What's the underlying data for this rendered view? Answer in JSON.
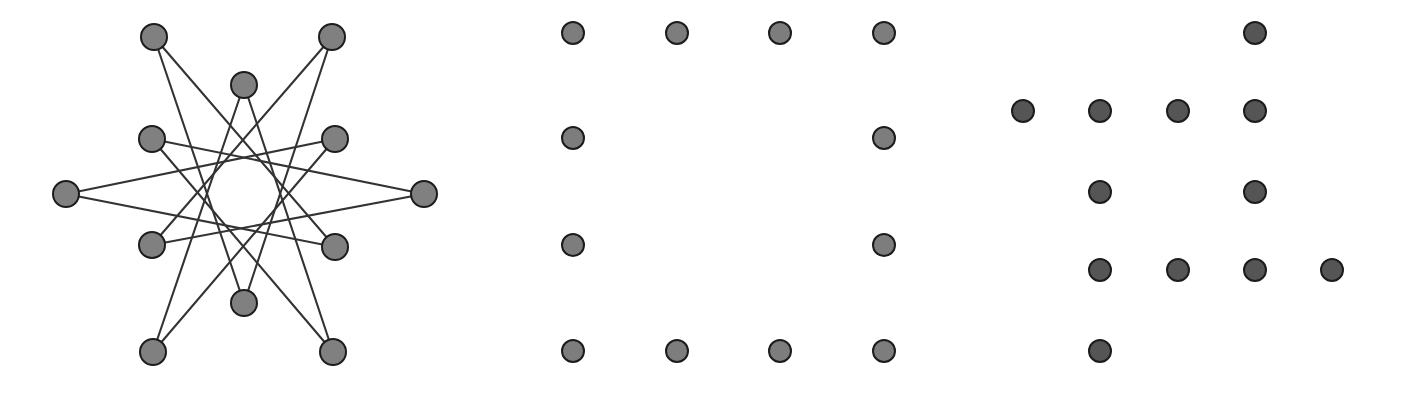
{
  "figure": {
    "width": 1402,
    "height": 394,
    "background": "#ffffff"
  },
  "style": {
    "node_fill": "#808080",
    "node_stroke": "#1c1c1c",
    "node_stroke_width": 2.0,
    "dot_fill_middle": "#7d7d7d",
    "dot_fill_right": "#555555",
    "dot_stroke": "#1c1c1c",
    "dot_stroke_width": 2.0,
    "edge_color": "#333333",
    "edge_width": 2.1
  },
  "chart_data": {
    "type": "scatter",
    "title": "",
    "xlabel": "",
    "ylabel": "",
    "xlim": [
      0,
      1402
    ],
    "ylim": [
      0,
      394
    ],
    "grid": false,
    "legend": null,
    "panels": [
      {
        "name": "star-polygon-graph",
        "label": "graph-panel",
        "node_radius": 13,
        "node_count": 12,
        "edge_count": 12,
        "nodes": [
          {
            "id": 0,
            "x": 244,
            "y": 85,
            "name": "node-top-center"
          },
          {
            "id": 1,
            "x": 332,
            "y": 37,
            "name": "node-top-right"
          },
          {
            "id": 2,
            "x": 335,
            "y": 139,
            "name": "node-upper-right"
          },
          {
            "id": 3,
            "x": 424,
            "y": 194,
            "name": "node-right"
          },
          {
            "id": 4,
            "x": 335,
            "y": 247,
            "name": "node-lower-right"
          },
          {
            "id": 5,
            "x": 333,
            "y": 352,
            "name": "node-bottom-right"
          },
          {
            "id": 6,
            "x": 244,
            "y": 303,
            "name": "node-bottom-center"
          },
          {
            "id": 7,
            "x": 153,
            "y": 352,
            "name": "node-bottom-left"
          },
          {
            "id": 8,
            "x": 152,
            "y": 245,
            "name": "node-lower-left"
          },
          {
            "id": 9,
            "x": 66,
            "y": 194,
            "name": "node-left"
          },
          {
            "id": 10,
            "x": 152,
            "y": 139,
            "name": "node-upper-left"
          },
          {
            "id": 11,
            "x": 154,
            "y": 37,
            "name": "node-top-left"
          }
        ],
        "edges": [
          [
            0,
            5
          ],
          [
            1,
            6
          ],
          [
            2,
            7
          ],
          [
            3,
            8
          ],
          [
            4,
            9
          ],
          [
            5,
            10
          ],
          [
            6,
            11
          ],
          [
            7,
            0
          ],
          [
            8,
            1
          ],
          [
            9,
            2
          ],
          [
            10,
            3
          ],
          [
            11,
            4
          ]
        ]
      },
      {
        "name": "boundary-ring-lattice",
        "label": "middle-dot-panel",
        "dot_radius": 11,
        "dot_count": 12,
        "columns_x": [
          573,
          677,
          780,
          884
        ],
        "rows_y": [
          33,
          138,
          245,
          351
        ],
        "dots": [
          {
            "x": 573,
            "y": 33
          },
          {
            "x": 677,
            "y": 33
          },
          {
            "x": 780,
            "y": 33
          },
          {
            "x": 884,
            "y": 33
          },
          {
            "x": 573,
            "y": 138
          },
          {
            "x": 884,
            "y": 138
          },
          {
            "x": 573,
            "y": 245
          },
          {
            "x": 884,
            "y": 245
          },
          {
            "x": 573,
            "y": 351
          },
          {
            "x": 677,
            "y": 351
          },
          {
            "x": 780,
            "y": 351
          },
          {
            "x": 884,
            "y": 351
          }
        ]
      },
      {
        "name": "cross-shaped-lattice",
        "label": "right-dot-panel",
        "dot_radius": 11,
        "dot_count": 12,
        "columns_x": [
          1023,
          1100,
          1178,
          1255,
          1332
        ],
        "rows_y": [
          33,
          111,
          192,
          270,
          351
        ],
        "dots": [
          {
            "x": 1255,
            "y": 33
          },
          {
            "x": 1023,
            "y": 111
          },
          {
            "x": 1100,
            "y": 111
          },
          {
            "x": 1178,
            "y": 111
          },
          {
            "x": 1255,
            "y": 111
          },
          {
            "x": 1100,
            "y": 192
          },
          {
            "x": 1255,
            "y": 192
          },
          {
            "x": 1100,
            "y": 270
          },
          {
            "x": 1178,
            "y": 270
          },
          {
            "x": 1255,
            "y": 270
          },
          {
            "x": 1332,
            "y": 270
          },
          {
            "x": 1100,
            "y": 351
          }
        ]
      }
    ]
  }
}
